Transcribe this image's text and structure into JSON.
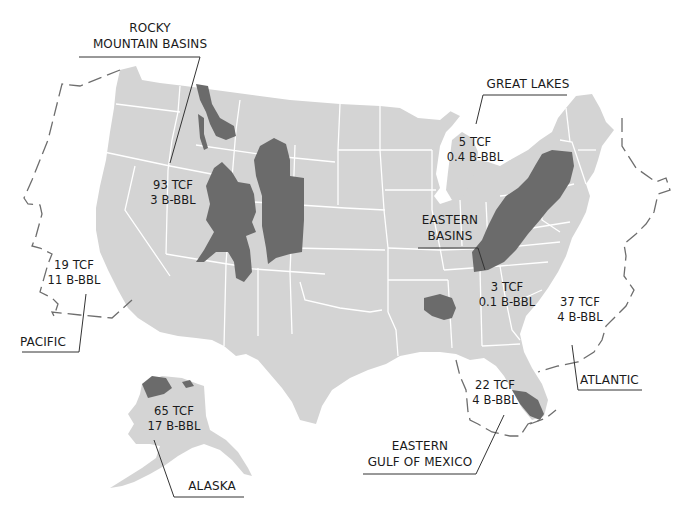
{
  "map": {
    "colors": {
      "land": "#d4d4d4",
      "state_border": "#ffffff",
      "basin": "#6b6b6b",
      "boundary_dash": "#6e6e6e",
      "leader_line": "#333333",
      "text": "#1a1a1a",
      "background": "#ffffff"
    },
    "units": {
      "gas": "TCF",
      "oil": "B-BBL"
    }
  },
  "regions": [
    {
      "id": "rocky-mountain-basins",
      "name_lines": [
        "ROCKY",
        "MOUNTAIN BASINS"
      ],
      "gas": "93 TCF",
      "oil": "3 B-BBL",
      "type": "onshore"
    },
    {
      "id": "great-lakes",
      "name_lines": [
        "GREAT LAKES"
      ],
      "gas": "5 TCF",
      "oil": "0.4 B-BBL",
      "type": "onshore"
    },
    {
      "id": "eastern-basins",
      "name_lines": [
        "EASTERN",
        "BASINS"
      ],
      "gas": "3 TCF",
      "oil": "0.1 B-BBL",
      "type": "onshore"
    },
    {
      "id": "pacific",
      "name_lines": [
        "PACIFIC"
      ],
      "gas": "19 TCF",
      "oil": "11 B-BBL",
      "type": "offshore"
    },
    {
      "id": "atlantic",
      "name_lines": [
        "ATLANTIC"
      ],
      "gas": "37 TCF",
      "oil": "4 B-BBL",
      "type": "offshore"
    },
    {
      "id": "eastern-gulf-of-mexico",
      "name_lines": [
        "EASTERN",
        "GULF OF MEXICO"
      ],
      "gas": "22 TCF",
      "oil": "4 B-BBL",
      "type": "offshore"
    },
    {
      "id": "alaska",
      "name_lines": [
        "ALASKA"
      ],
      "gas": "65 TCF",
      "oil": "17 B-BBL",
      "type": "onshore"
    }
  ]
}
